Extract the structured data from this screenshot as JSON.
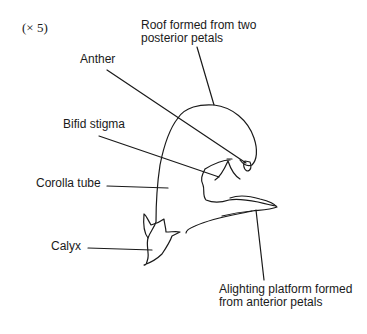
{
  "diagram": {
    "magnification": "(× 5)",
    "labels": {
      "roof": [
        "Roof formed from two",
        "posterior petals"
      ],
      "anther": "Anther",
      "bifid_stigma": "Bifid stigma",
      "corolla_tube": "Corolla tube",
      "calyx": "Calyx",
      "alighting_platform": [
        "Alighting platform formed",
        "from anterior petals"
      ]
    }
  }
}
